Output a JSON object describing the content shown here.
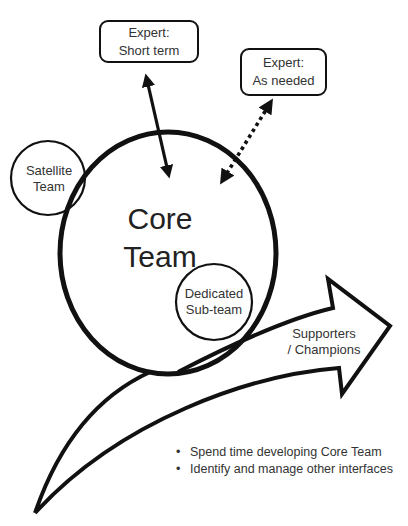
{
  "diagram": {
    "core_team": {
      "line1": "Core",
      "line2": "Team"
    },
    "satellite_team": {
      "line1": "Satellite",
      "line2": "Team"
    },
    "dedicated_subteam": {
      "line1": "Dedicated",
      "line2": "Sub-team"
    },
    "expert_short_term": {
      "line1": "Expert:",
      "line2": "Short term",
      "connector": "solid-double-arrow"
    },
    "expert_as_needed": {
      "line1": "Expert:",
      "line2": "As needed",
      "connector": "dotted-double-arrow"
    },
    "supporters_arrow": {
      "line1": "Supporters",
      "line2": "/ Champions"
    },
    "bullets": [
      "Spend time developing Core Team",
      "Identify and manage other interfaces"
    ]
  },
  "colors": {
    "stroke": "#111111",
    "text": "#333333",
    "background": "#ffffff"
  }
}
